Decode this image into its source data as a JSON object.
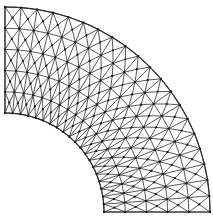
{
  "figure": {
    "kind": "fem-mesh",
    "background_color": "#ffffff",
    "edge_color": "#3a3a3a",
    "boundary_color": "#2b2b2b",
    "node_color": "#1a1a1a",
    "edge_width": 0.85,
    "boundary_width": 1.15,
    "node_radius": 1.15
  },
  "chart_data": {
    "type": "mesh",
    "geometry": {
      "shape": "quarter-annulus",
      "center_x": 5,
      "center_y": 212,
      "inner_radius": 99,
      "outer_radius": 205,
      "start_angle_deg": 0,
      "end_angle_deg": 90
    },
    "discretization": {
      "radial_divisions": 5,
      "angular_divisions": 20,
      "quad_cells": 100,
      "triangles_per_quad": 4,
      "triangle_count": 400,
      "corner_node_count": 126,
      "center_node_count": 100,
      "total_node_count": 226
    },
    "boundaries": [
      {
        "name": "top-edge",
        "type": "straight-radial",
        "angle_deg": 90,
        "from": [
          5,
          113
        ],
        "to": [
          5,
          7
        ]
      },
      {
        "name": "bottom-edge",
        "type": "straight-radial",
        "angle_deg": 0,
        "from": [
          104,
          212
        ],
        "to": [
          210,
          212
        ]
      },
      {
        "name": "inner-arc",
        "type": "circular-arc",
        "radius": 99
      },
      {
        "name": "outer-arc",
        "type": "circular-arc",
        "radius": 205
      }
    ],
    "xlim": [
      0,
      213
    ],
    "ylim": [
      0,
      220
    ],
    "grid": false,
    "legend": null,
    "axis_labels": {
      "x": "",
      "y": ""
    },
    "tick_labels": {
      "x": [],
      "y": []
    },
    "annotations": []
  }
}
